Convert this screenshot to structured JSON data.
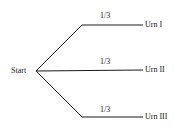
{
  "diagram": {
    "type": "probability-tree",
    "root": {
      "label": "Start"
    },
    "branches": [
      {
        "probability": "1/3",
        "leaf": "Urn I"
      },
      {
        "probability": "1/3",
        "leaf": "Urn II"
      },
      {
        "probability": "1/3",
        "leaf": "Urn III"
      }
    ]
  }
}
